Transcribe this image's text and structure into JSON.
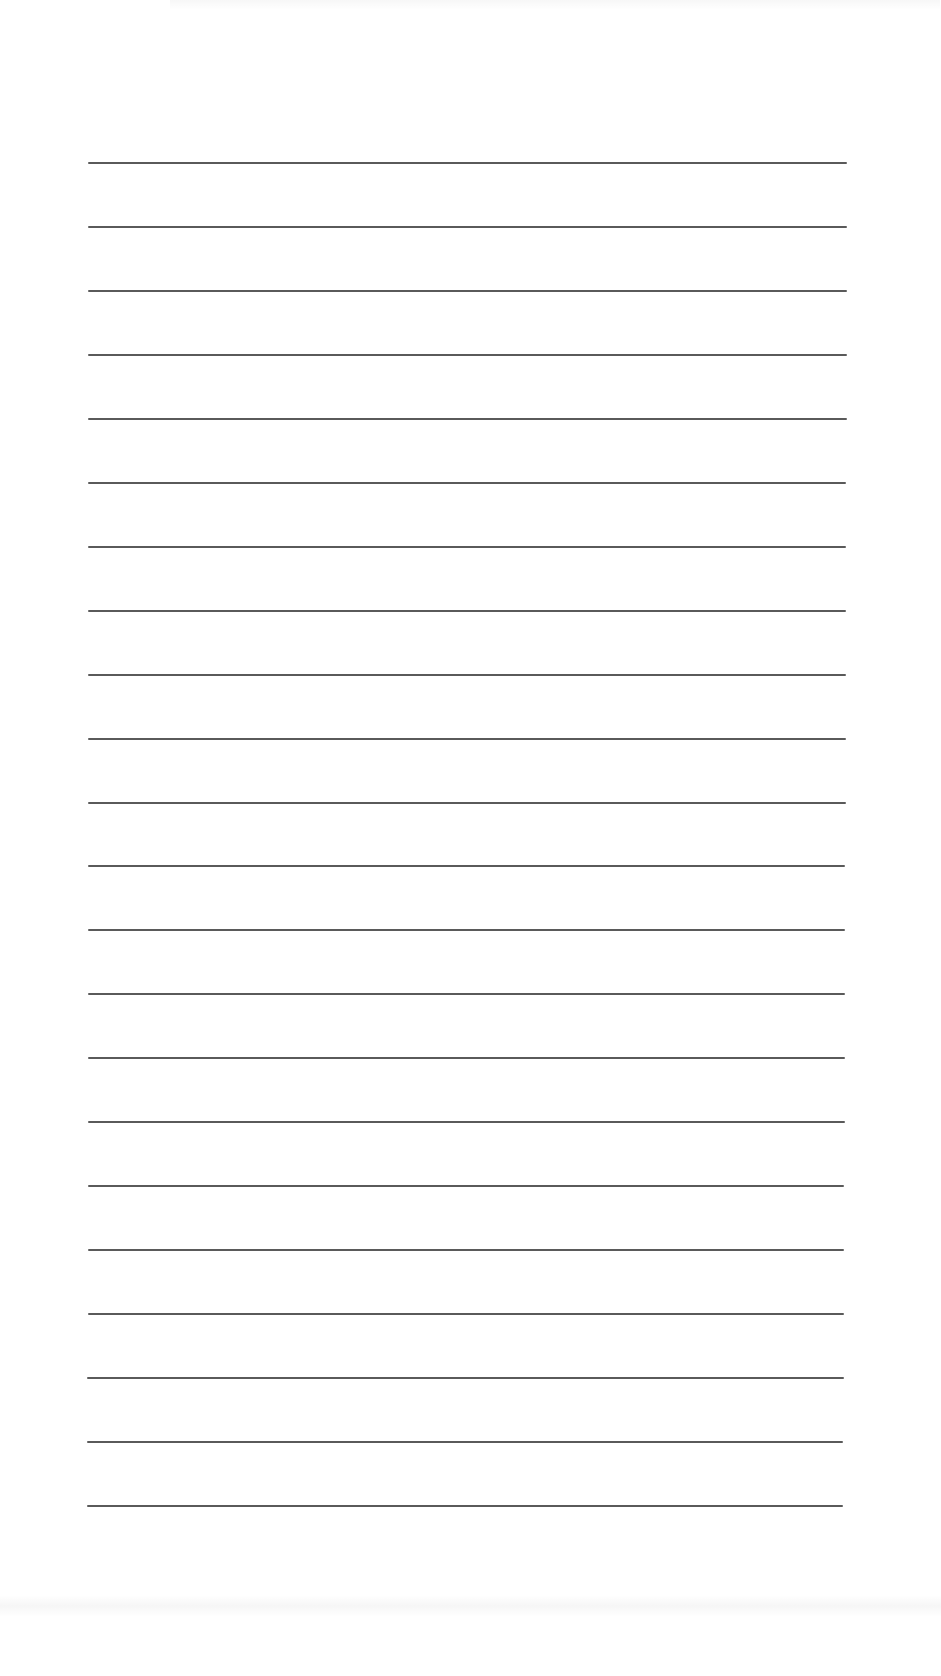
{
  "document": {
    "type": "lined-paper",
    "background_color": "#ffffff",
    "rule_color": "#5a5a5a",
    "rule_count": 22,
    "rules": [
      {
        "y": 162,
        "x1": 88,
        "x2": 847
      },
      {
        "y": 226,
        "x1": 88,
        "x2": 847
      },
      {
        "y": 290,
        "x1": 88,
        "x2": 847
      },
      {
        "y": 354,
        "x1": 88,
        "x2": 847
      },
      {
        "y": 418,
        "x1": 88,
        "x2": 847
      },
      {
        "y": 482,
        "x1": 88,
        "x2": 846
      },
      {
        "y": 546,
        "x1": 88,
        "x2": 846
      },
      {
        "y": 610,
        "x1": 88,
        "x2": 846
      },
      {
        "y": 674,
        "x1": 88,
        "x2": 846
      },
      {
        "y": 738,
        "x1": 88,
        "x2": 846
      },
      {
        "y": 802,
        "x1": 88,
        "x2": 846
      },
      {
        "y": 865,
        "x1": 88,
        "x2": 845
      },
      {
        "y": 929,
        "x1": 88,
        "x2": 845
      },
      {
        "y": 993,
        "x1": 88,
        "x2": 845
      },
      {
        "y": 1057,
        "x1": 88,
        "x2": 845
      },
      {
        "y": 1121,
        "x1": 88,
        "x2": 845
      },
      {
        "y": 1185,
        "x1": 88,
        "x2": 844
      },
      {
        "y": 1249,
        "x1": 88,
        "x2": 844
      },
      {
        "y": 1313,
        "x1": 88,
        "x2": 844
      },
      {
        "y": 1377,
        "x1": 87,
        "x2": 844
      },
      {
        "y": 1441,
        "x1": 87,
        "x2": 843
      },
      {
        "y": 1505,
        "x1": 87,
        "x2": 843
      }
    ]
  }
}
